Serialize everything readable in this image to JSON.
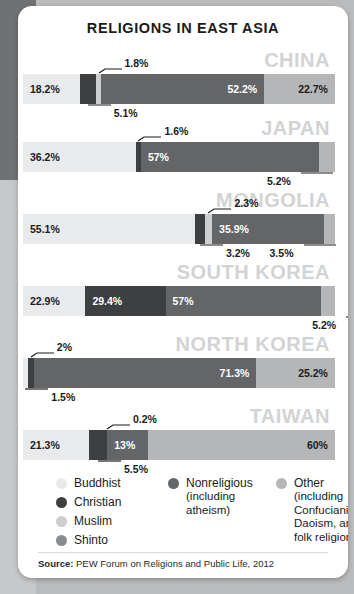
{
  "title": "RELIGIONS IN EAST ASIA",
  "colors": {
    "buddhist": "#e9eaeb",
    "christian": "#3e3f41",
    "muslim": "#cdced0",
    "shinto": "#8a8c8e",
    "nonreligious": "#636567",
    "other": "#b4b6b8",
    "country_label": "#d2d3d5",
    "card": "#ffffff",
    "backdrop": "#b9bbbd"
  },
  "legend": {
    "columns": [
      {
        "items": [
          {
            "label": "Buddhist",
            "sub": "",
            "swatch": "buddhist"
          },
          {
            "label": "Christian",
            "sub": "",
            "swatch": "christian"
          },
          {
            "label": "Muslim",
            "sub": "",
            "swatch": "muslim"
          },
          {
            "label": "Shinto",
            "sub": "",
            "swatch": "shinto"
          }
        ]
      },
      {
        "items": [
          {
            "label": "Nonreligious",
            "sub": "(including atheism)",
            "swatch": "nonreligious"
          }
        ]
      },
      {
        "items": [
          {
            "label": "Other",
            "sub": "(including Confucianism, Daoism, and folk religions)",
            "swatch": "other"
          }
        ]
      }
    ]
  },
  "source": {
    "prefix": "Source:",
    "text": " PEW Forum on Religions and Public Life, 2012"
  },
  "chart_data": {
    "type": "bar",
    "title": "RELIGIONS IN EAST ASIA",
    "subtype": "stacked-horizontal-100",
    "xlabel": "",
    "ylabel": "",
    "xlim": [
      0,
      100
    ],
    "grid": false,
    "legend_position": "bottom",
    "categories": [
      "CHINA",
      "JAPAN",
      "MONGOLIA",
      "SOUTH KOREA",
      "NORTH KOREA",
      "TAIWAN"
    ],
    "series": [
      {
        "name": "Buddhist",
        "values": [
          18.2,
          36.2,
          55.1,
          22.9,
          1.5,
          21.3
        ]
      },
      {
        "name": "Christian",
        "values": [
          5.1,
          1.6,
          3.2,
          29.4,
          2.0,
          5.5
        ]
      },
      {
        "name": "Muslim",
        "values": [
          1.8,
          0.0,
          2.3,
          0.0,
          0.0,
          0.2
        ]
      },
      {
        "name": "Shinto",
        "values": [
          0.0,
          0.0,
          0.0,
          0.0,
          0.0,
          0.0
        ]
      },
      {
        "name": "Nonreligious",
        "values": [
          52.2,
          57.0,
          35.9,
          57.0,
          71.3,
          13.0
        ]
      },
      {
        "name": "Other",
        "values": [
          22.7,
          5.2,
          3.5,
          5.2,
          25.2,
          60.0
        ]
      }
    ],
    "countries": [
      {
        "name": "CHINA",
        "segments": [
          {
            "religion": "Buddhist",
            "value": 18.2,
            "label": "18.2%",
            "placement": "inside-left",
            "text": "dark"
          },
          {
            "religion": "Christian",
            "value": 5.1,
            "label": "5.1%",
            "placement": "callout-below",
            "text": "dark"
          },
          {
            "religion": "Muslim",
            "value": 1.8,
            "label": "1.8%",
            "placement": "callout-above",
            "text": "dark"
          },
          {
            "religion": "Nonreligious",
            "value": 52.2,
            "label": "52.2%",
            "placement": "inside-right",
            "text": "light"
          },
          {
            "religion": "Other",
            "value": 22.7,
            "label": "22.7%",
            "placement": "inside-right",
            "text": "dark"
          }
        ]
      },
      {
        "name": "JAPAN",
        "segments": [
          {
            "religion": "Buddhist",
            "value": 36.2,
            "label": "36.2%",
            "placement": "inside-left",
            "text": "dark"
          },
          {
            "religion": "Christian",
            "value": 1.6,
            "label": "1.6%",
            "placement": "callout-above",
            "text": "dark"
          },
          {
            "religion": "Nonreligious",
            "value": 57.0,
            "label": "57%",
            "placement": "inside-left",
            "text": "light"
          },
          {
            "religion": "Other",
            "value": 5.2,
            "label": "5.2%",
            "placement": "callout-below",
            "text": "dark"
          }
        ]
      },
      {
        "name": "MONGOLIA",
        "segments": [
          {
            "religion": "Buddhist",
            "value": 55.1,
            "label": "55.1%",
            "placement": "inside-left",
            "text": "dark"
          },
          {
            "religion": "Christian",
            "value": 3.2,
            "label": "3.2%",
            "placement": "callout-below",
            "text": "dark"
          },
          {
            "religion": "Muslim",
            "value": 2.3,
            "label": "2.3%",
            "placement": "callout-above",
            "text": "dark"
          },
          {
            "religion": "Nonreligious",
            "value": 35.9,
            "label": "35.9%",
            "placement": "inside-left",
            "text": "light"
          },
          {
            "religion": "Other",
            "value": 3.5,
            "label": "3.5%",
            "placement": "callout-below",
            "text": "dark"
          }
        ]
      },
      {
        "name": "SOUTH KOREA",
        "segments": [
          {
            "religion": "Buddhist",
            "value": 22.9,
            "label": "22.9%",
            "placement": "inside-left",
            "text": "dark"
          },
          {
            "religion": "Christian",
            "value": 29.4,
            "label": "29.4%",
            "placement": "inside-left",
            "text": "light"
          },
          {
            "religion": "Nonreligious",
            "value": 57.0,
            "label": "57%",
            "placement": "inside-left",
            "text": "light"
          },
          {
            "religion": "Other",
            "value": 5.2,
            "label": "5.2%",
            "placement": "callout-below",
            "text": "dark"
          }
        ]
      },
      {
        "name": "NORTH KOREA",
        "segments": [
          {
            "religion": "Buddhist",
            "value": 1.5,
            "label": "1.5%",
            "placement": "callout-below",
            "text": "dark"
          },
          {
            "religion": "Christian",
            "value": 2.0,
            "label": "2%",
            "placement": "callout-above",
            "text": "dark"
          },
          {
            "religion": "Nonreligious",
            "value": 71.3,
            "label": "71.3%",
            "placement": "inside-right",
            "text": "light"
          },
          {
            "religion": "Other",
            "value": 25.2,
            "label": "25.2%",
            "placement": "inside-right",
            "text": "dark"
          }
        ]
      },
      {
        "name": "TAIWAN",
        "segments": [
          {
            "religion": "Buddhist",
            "value": 21.3,
            "label": "21.3%",
            "placement": "inside-left",
            "text": "dark"
          },
          {
            "religion": "Christian",
            "value": 5.5,
            "label": "5.5%",
            "placement": "callout-below",
            "text": "dark"
          },
          {
            "religion": "Muslim",
            "value": 0.2,
            "label": "0.2%",
            "placement": "callout-above",
            "text": "dark"
          },
          {
            "religion": "Nonreligious",
            "value": 13.0,
            "label": "13%",
            "placement": "inside-left",
            "text": "light"
          },
          {
            "religion": "Other",
            "value": 60.0,
            "label": "60%",
            "placement": "inside-right",
            "text": "dark"
          }
        ]
      }
    ]
  }
}
